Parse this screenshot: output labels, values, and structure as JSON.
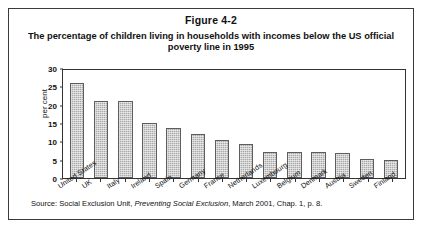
{
  "figure": {
    "number": "Figure 4-2",
    "title": "The percentage of children living in households with incomes below the US official poverty line in 1995",
    "source_prefix": "Source: Social Exclusion Unit,",
    "source_italic": "Preventing Social Exclusion",
    "source_suffix": ", March 2001, Chap. 1, p. 8.",
    "border_color": "#3a3a3a"
  },
  "chart_data": {
    "type": "bar",
    "title": "The percentage of children living in households with incomes below the US official poverty line in 1995",
    "xlabel": "",
    "ylabel": "per cent",
    "ylim": [
      0,
      30
    ],
    "yticks": [
      0,
      5,
      10,
      15,
      20,
      25,
      30
    ],
    "ytick_labels": [
      "0",
      "5",
      "10",
      "15",
      "20",
      "25",
      "30"
    ],
    "grid": false,
    "legend": "none",
    "bar_color": "#a8a8a8",
    "bar_edge_color": "#5d5d5d",
    "categories": [
      "United States",
      "UK",
      "Italy",
      "Ireland",
      "Spain",
      "Germany",
      "France",
      "Netherlands",
      "Luxembourg",
      "Belgium",
      "Denmark",
      "Austria",
      "Sweden",
      "Finland"
    ],
    "values": [
      26.3,
      21.5,
      21.5,
      15.3,
      13.8,
      12.3,
      10.5,
      9.5,
      7.3,
      7.3,
      7.2,
      7.0,
      5.2,
      5.0
    ]
  }
}
